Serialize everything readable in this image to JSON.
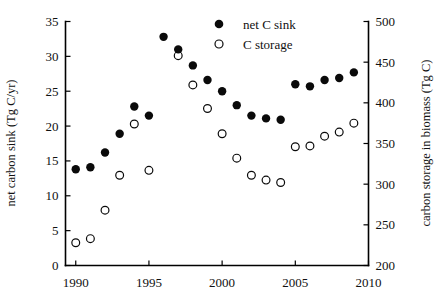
{
  "chart_data": {
    "type": "scatter",
    "title": "",
    "xlabel": "",
    "ylabel": "net carbon sink (Tg C/yr)",
    "y2label": "carbon storage in biomass (Tg C)",
    "xlim": [
      1989.3,
      2010.0
    ],
    "ylim": [
      0,
      35
    ],
    "y2lim": [
      200,
      500
    ],
    "grid": false,
    "legend_position": "top-center",
    "xticks": [
      1990,
      1995,
      2000,
      2005,
      2010
    ],
    "xticklabels": [
      "1990",
      "1995",
      "2000",
      "2005",
      "2010"
    ],
    "yticks": [
      0,
      5,
      10,
      15,
      20,
      25,
      30,
      35
    ],
    "yticklabels": [
      "0",
      "5",
      "10",
      "15",
      "20",
      "25",
      "30",
      "35"
    ],
    "y2ticks": [
      200,
      250,
      300,
      350,
      400,
      450,
      500
    ],
    "y2ticklabels": [
      "200",
      "250",
      "300",
      "350",
      "400",
      "450",
      "500"
    ],
    "x": [
      1990,
      1991,
      1992,
      1993,
      1994,
      1995,
      1996,
      1997,
      1998,
      1999,
      2000,
      2001,
      2002,
      2003,
      2004,
      2005,
      2006,
      2007,
      2008,
      2009
    ],
    "series": [
      {
        "name": "net C sink",
        "marker": "filled-circle",
        "axis": "left",
        "units": "Tg C/yr",
        "values": [
          13.8,
          14.1,
          16.2,
          18.9,
          22.8,
          21.5,
          32.8,
          31.0,
          28.7,
          26.6,
          25.0,
          23.0,
          21.5,
          21.1,
          20.9,
          26.0,
          25.7,
          26.6,
          26.9,
          27.7
        ]
      },
      {
        "name": "C storage",
        "marker": "open-circle",
        "axis": "right",
        "units": "Tg C",
        "values_left_scale": [
          3.3,
          3.8,
          7.9,
          12.9,
          20.3,
          13.6,
          null,
          30.1,
          25.9,
          22.5,
          18.9,
          15.4,
          13.0,
          12.3,
          11.9,
          17.0,
          17.2,
          18.5,
          19.1,
          20.4
        ],
        "values": [
          228,
          233,
          268,
          311,
          374,
          317,
          null,
          458,
          422,
          393,
          362,
          332,
          311,
          305,
          302,
          346,
          347,
          359,
          364,
          375
        ]
      }
    ],
    "legend": [
      {
        "label": "net C sink",
        "marker": "filled-circle"
      },
      {
        "label": "C storage",
        "marker": "open-circle"
      }
    ]
  }
}
